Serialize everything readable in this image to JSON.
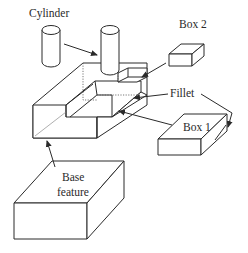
{
  "diagram": {
    "labels": {
      "cylinder": "Cylinder",
      "box2": "Box 2",
      "fillet": "Fillet",
      "box1": "Box 1",
      "base_line1": "Base",
      "base_line2": "feature"
    },
    "parts": [
      {
        "id": "cylinder",
        "label": "Cylinder",
        "role": "added feature"
      },
      {
        "id": "box2",
        "label": "Box 2",
        "role": "subtracted feature"
      },
      {
        "id": "fillet",
        "label": "Fillet",
        "role": "edge feature"
      },
      {
        "id": "box1",
        "label": "Box 1",
        "role": "subtracted feature"
      },
      {
        "id": "base",
        "label": "Base feature",
        "role": "base"
      }
    ],
    "colors": {
      "line": "#2a2a2a",
      "background": "#ffffff"
    }
  }
}
